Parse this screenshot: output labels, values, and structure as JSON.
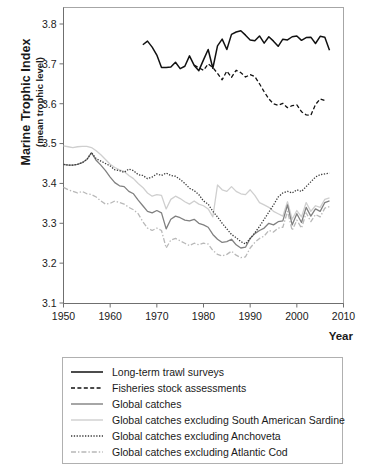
{
  "axes": {
    "ylabel_main": "Marine Trophic Index",
    "ylabel_sub": "(mean trophic level)",
    "xlabel": "Year",
    "yticks": [
      "3.8",
      "3.7",
      "3.6",
      "3.5",
      "3.4",
      "3.3",
      "3.2",
      "3.1"
    ],
    "xticks": [
      "1950",
      "1960",
      "1970",
      "1980",
      "1990",
      "2000",
      "2010"
    ]
  },
  "legend": {
    "items": [
      {
        "label": "Long-term trawl surveys",
        "style": "solid",
        "color": "#111111",
        "width": 1.5
      },
      {
        "label": "Fisheries stock assessments",
        "style": "dashed",
        "color": "#111111",
        "width": 1.5
      },
      {
        "label": "Global catches",
        "style": "solid",
        "color": "#808080",
        "width": 1.4
      },
      {
        "label": "Global catches excluding South American Sardine",
        "style": "solid",
        "color": "#cfcfcf",
        "width": 1.4
      },
      {
        "label": "Global catches excluding Anchoveta",
        "style": "dotted",
        "color": "#3a3a3a",
        "width": 1.4
      },
      {
        "label": "Global catches excluding Atlantic Cod",
        "style": "dashdot",
        "color": "#b8b8b8",
        "width": 1.4
      }
    ]
  },
  "chart_data": {
    "type": "line",
    "title": "",
    "xlabel": "Year",
    "ylabel": "Marine Trophic Index (mean trophic level)",
    "xlim": [
      1950,
      2010
    ],
    "ylim": [
      3.1,
      3.85
    ],
    "grid": false,
    "legend_position": "below-plot",
    "series": [
      {
        "name": "Long-term trawl surveys",
        "style": "solid",
        "color": "#111111",
        "x": [
          1967,
          1968,
          1969,
          1970,
          1971,
          1972,
          1973,
          1974,
          1975,
          1976,
          1977,
          1978,
          1979,
          1980,
          1981,
          1982,
          1983,
          1984,
          1985,
          1986,
          1987,
          1988,
          1989,
          1990,
          1991,
          1992,
          1993,
          1994,
          1995,
          1996,
          1997,
          1998,
          1999,
          2000,
          2001,
          2002,
          2003,
          2004,
          2005,
          2006,
          2007
        ],
        "y": [
          3.748,
          3.757,
          3.742,
          3.722,
          3.691,
          3.691,
          3.692,
          3.704,
          3.688,
          3.694,
          3.72,
          3.696,
          3.683,
          3.71,
          3.736,
          3.689,
          3.745,
          3.762,
          3.736,
          3.774,
          3.78,
          3.783,
          3.772,
          3.76,
          3.758,
          3.77,
          3.752,
          3.768,
          3.757,
          3.744,
          3.762,
          3.76,
          3.768,
          3.77,
          3.759,
          3.766,
          3.767,
          3.751,
          3.769,
          3.767,
          3.734
        ]
      },
      {
        "name": "Fisheries stock assessments",
        "style": "dashed",
        "color": "#111111",
        "x": [
          1978,
          1979,
          1980,
          1981,
          1982,
          1983,
          1984,
          1985,
          1986,
          1987,
          1988,
          1989,
          1990,
          1991,
          1992,
          1993,
          1994,
          1995,
          1996,
          1997,
          1998,
          1999,
          2000,
          2001,
          2002,
          2003,
          2004,
          2005,
          2006
        ],
        "y": [
          3.697,
          3.69,
          3.684,
          3.7,
          3.691,
          3.676,
          3.66,
          3.682,
          3.666,
          3.684,
          3.678,
          3.667,
          3.673,
          3.668,
          3.65,
          3.63,
          3.612,
          3.6,
          3.596,
          3.601,
          3.59,
          3.595,
          3.597,
          3.58,
          3.572,
          3.571,
          3.598,
          3.612,
          3.608
        ]
      },
      {
        "name": "Global catches",
        "style": "solid",
        "color": "#808080",
        "x": [
          1950,
          1951,
          1952,
          1953,
          1954,
          1955,
          1956,
          1957,
          1958,
          1959,
          1960,
          1961,
          1962,
          1963,
          1964,
          1965,
          1966,
          1967,
          1968,
          1969,
          1970,
          1971,
          1972,
          1973,
          1974,
          1975,
          1976,
          1977,
          1978,
          1979,
          1980,
          1981,
          1982,
          1983,
          1984,
          1985,
          1986,
          1987,
          1988,
          1989,
          1990,
          1991,
          1992,
          1993,
          1994,
          1995,
          1996,
          1997,
          1998,
          1999,
          2000,
          2001,
          2002,
          2003,
          2004,
          2005,
          2006,
          2007
        ],
        "y": [
          3.448,
          3.446,
          3.446,
          3.448,
          3.452,
          3.46,
          3.477,
          3.458,
          3.446,
          3.432,
          3.416,
          3.402,
          3.394,
          3.392,
          3.38,
          3.374,
          3.358,
          3.344,
          3.33,
          3.326,
          3.332,
          3.326,
          3.286,
          3.31,
          3.318,
          3.314,
          3.308,
          3.306,
          3.31,
          3.3,
          3.296,
          3.29,
          3.272,
          3.26,
          3.252,
          3.254,
          3.26,
          3.246,
          3.238,
          3.24,
          3.262,
          3.274,
          3.282,
          3.288,
          3.3,
          3.296,
          3.304,
          3.306,
          3.346,
          3.296,
          3.324,
          3.302,
          3.34,
          3.318,
          3.336,
          3.33,
          3.352,
          3.356
        ]
      },
      {
        "name": "Global catches excluding South American Sardine",
        "style": "solid",
        "color": "#cfcfcf",
        "x": [
          1950,
          1951,
          1952,
          1953,
          1954,
          1955,
          1956,
          1957,
          1958,
          1959,
          1960,
          1961,
          1962,
          1963,
          1964,
          1965,
          1966,
          1967,
          1968,
          1969,
          1970,
          1971,
          1972,
          1973,
          1974,
          1975,
          1976,
          1977,
          1978,
          1979,
          1980,
          1981,
          1982,
          1983,
          1984,
          1985,
          1986,
          1987,
          1988,
          1989,
          1990,
          1991,
          1992,
          1993,
          1994,
          1995,
          1996,
          1997,
          1998,
          1999,
          2000,
          2001,
          2002,
          2003,
          2004,
          2005,
          2006,
          2007
        ],
        "y": [
          3.494,
          3.492,
          3.49,
          3.492,
          3.493,
          3.493,
          3.49,
          3.482,
          3.472,
          3.46,
          3.448,
          3.44,
          3.434,
          3.43,
          3.42,
          3.412,
          3.4,
          3.39,
          3.376,
          3.368,
          3.372,
          3.37,
          3.336,
          3.36,
          3.368,
          3.362,
          3.354,
          3.348,
          3.356,
          3.348,
          3.344,
          3.336,
          3.316,
          3.396,
          3.384,
          3.38,
          3.392,
          3.38,
          3.374,
          3.372,
          3.384,
          3.37,
          3.352,
          3.346,
          3.34,
          3.33,
          3.324,
          3.318,
          3.354,
          3.31,
          3.332,
          3.316,
          3.352,
          3.33,
          3.344,
          3.34,
          3.36,
          3.364
        ]
      },
      {
        "name": "Global catches excluding Anchoveta",
        "style": "dotted",
        "color": "#3a3a3a",
        "x": [
          1950,
          1951,
          1952,
          1953,
          1954,
          1955,
          1956,
          1957,
          1958,
          1959,
          1960,
          1961,
          1962,
          1963,
          1964,
          1965,
          1966,
          1967,
          1968,
          1969,
          1970,
          1971,
          1972,
          1973,
          1974,
          1975,
          1976,
          1977,
          1978,
          1979,
          1980,
          1981,
          1982,
          1983,
          1984,
          1985,
          1986,
          1987,
          1988,
          1989,
          1990,
          1991,
          1992,
          1993,
          1994,
          1995,
          1996,
          1997,
          1998,
          1999,
          2000,
          2001,
          2002,
          2003,
          2004,
          2005,
          2006,
          2007
        ],
        "y": [
          3.448,
          3.446,
          3.446,
          3.448,
          3.452,
          3.46,
          3.477,
          3.462,
          3.456,
          3.45,
          3.444,
          3.434,
          3.432,
          3.428,
          3.436,
          3.432,
          3.422,
          3.42,
          3.412,
          3.416,
          3.424,
          3.42,
          3.426,
          3.42,
          3.418,
          3.41,
          3.4,
          3.388,
          3.382,
          3.372,
          3.356,
          3.348,
          3.33,
          3.316,
          3.3,
          3.286,
          3.272,
          3.264,
          3.254,
          3.248,
          3.262,
          3.276,
          3.292,
          3.31,
          3.328,
          3.346,
          3.366,
          3.376,
          3.38,
          3.376,
          3.384,
          3.38,
          3.392,
          3.404,
          3.416,
          3.422,
          3.424,
          3.426
        ]
      },
      {
        "name": "Global catches excluding Atlantic Cod",
        "style": "dashdot",
        "color": "#b8b8b8",
        "x": [
          1950,
          1951,
          1952,
          1953,
          1954,
          1955,
          1956,
          1957,
          1958,
          1959,
          1960,
          1961,
          1962,
          1963,
          1964,
          1965,
          1966,
          1967,
          1968,
          1969,
          1970,
          1971,
          1972,
          1973,
          1974,
          1975,
          1976,
          1977,
          1978,
          1979,
          1980,
          1981,
          1982,
          1983,
          1984,
          1985,
          1986,
          1987,
          1988,
          1989,
          1990,
          1991,
          1992,
          1993,
          1994,
          1995,
          1996,
          1997,
          1998,
          1999,
          2000,
          2001,
          2002,
          2003,
          2004,
          2005,
          2006,
          2007
        ],
        "y": [
          3.39,
          3.384,
          3.38,
          3.376,
          3.38,
          3.374,
          3.372,
          3.366,
          3.356,
          3.348,
          3.35,
          3.356,
          3.352,
          3.348,
          3.34,
          3.334,
          3.324,
          3.304,
          3.288,
          3.282,
          3.288,
          3.282,
          3.238,
          3.258,
          3.262,
          3.256,
          3.25,
          3.244,
          3.25,
          3.246,
          3.25,
          3.248,
          3.232,
          3.222,
          3.218,
          3.222,
          3.23,
          3.22,
          3.214,
          3.216,
          3.238,
          3.252,
          3.262,
          3.268,
          3.282,
          3.278,
          3.288,
          3.29,
          3.33,
          3.282,
          3.308,
          3.288,
          3.326,
          3.304,
          3.322,
          3.316,
          3.338,
          3.342
        ]
      }
    ]
  }
}
